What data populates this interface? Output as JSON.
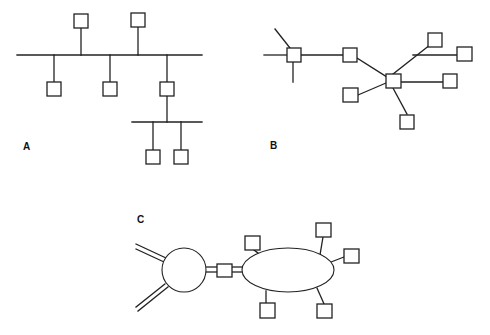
{
  "colors": {
    "stroke": "#222222",
    "background": "#ffffff",
    "label": "#111111"
  },
  "diagrams": [
    {
      "id": "A",
      "label": "A",
      "label_pos": [
        23,
        150
      ],
      "topology": "bus",
      "lines": [
        [
          17,
          55,
          202,
          55
        ],
        [
          81,
          28,
          81,
          55
        ],
        [
          138,
          27,
          138,
          55
        ],
        [
          54,
          55,
          54,
          82
        ],
        [
          110,
          55,
          110,
          82
        ],
        [
          167,
          55,
          167,
          82
        ],
        [
          167,
          96,
          167,
          122
        ],
        [
          132,
          122,
          202,
          122
        ],
        [
          153,
          122,
          153,
          150
        ],
        [
          181,
          122,
          181,
          150
        ]
      ],
      "nodes": [
        [
          74,
          14,
          14,
          14
        ],
        [
          131,
          13,
          14,
          14
        ],
        [
          47,
          82,
          14,
          14
        ],
        [
          103,
          82,
          14,
          14
        ],
        [
          160,
          82,
          14,
          14
        ],
        [
          146,
          150,
          14,
          14
        ],
        [
          174,
          150,
          14,
          14
        ]
      ]
    },
    {
      "id": "B",
      "label": "B",
      "label_pos": [
        270,
        149
      ],
      "topology": "star",
      "lines": [
        [
          264,
          55,
          287,
          55
        ],
        [
          275,
          29,
          290,
          48
        ],
        [
          293,
          62,
          293,
          82
        ],
        [
          301,
          55,
          343,
          55
        ],
        [
          357,
          58,
          387,
          77
        ],
        [
          393,
          74,
          430,
          45
        ],
        [
          413,
          55,
          457,
          55
        ],
        [
          401,
          82,
          443,
          82
        ],
        [
          358,
          95,
          386,
          83
        ],
        [
          393,
          88,
          407,
          114
        ]
      ],
      "nodes": [
        [
          287,
          48,
          14,
          14
        ],
        [
          343,
          48,
          14,
          14
        ],
        [
          386,
          74,
          15,
          14
        ],
        [
          428,
          33,
          14,
          14
        ],
        [
          457,
          47,
          15,
          14
        ],
        [
          443,
          74,
          14,
          14
        ],
        [
          343,
          88,
          15,
          14
        ],
        [
          400,
          115,
          14,
          14
        ]
      ]
    },
    {
      "id": "C",
      "label": "C",
      "label_pos": [
        137,
        223
      ],
      "topology": "ring-bridge",
      "double_lines": [
        [
          [
            136,
            244,
            166,
            258
          ],
          [
            136,
            249,
            164,
            262
          ]
        ],
        [
          [
            136,
            307,
            165,
            284
          ],
          [
            138,
            311,
            168,
            287
          ]
        ],
        [
          [
            206,
            267,
            217,
            267
          ],
          [
            206,
            272,
            217,
            272
          ]
        ],
        [
          [
            232,
            267,
            243,
            267
          ],
          [
            232,
            272,
            243,
            272
          ]
        ]
      ],
      "circle": {
        "cx": 184,
        "cy": 270,
        "r": 22
      },
      "ellipse": {
        "cx": 288,
        "cy": 270,
        "rx": 46,
        "ry": 22
      },
      "lines": [
        [
          254,
          250,
          258,
          253
        ],
        [
          323,
          237,
          320,
          255
        ],
        [
          344,
          257,
          331,
          262
        ],
        [
          266,
          291,
          266,
          303
        ],
        [
          317,
          288,
          324,
          304
        ]
      ],
      "nodes": [
        [
          217,
          264,
          15,
          13
        ],
        [
          245,
          236,
          15,
          14
        ],
        [
          316,
          223,
          15,
          14
        ],
        [
          344,
          249,
          15,
          14
        ],
        [
          260,
          303,
          15,
          15
        ],
        [
          317,
          304,
          15,
          14
        ]
      ]
    }
  ]
}
